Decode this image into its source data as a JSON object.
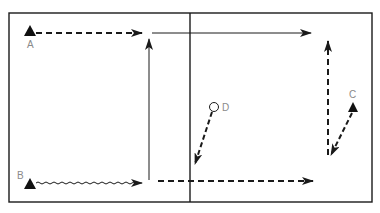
{
  "diagram": {
    "type": "play-diagram",
    "colors": {
      "line": "#1a1a1a",
      "label": "#8a8a8a",
      "background": "#ffffff"
    },
    "players": [
      {
        "id": "A",
        "label": "A",
        "marker": "triangle",
        "x": 30,
        "y": 31
      },
      {
        "id": "B",
        "label": "B",
        "marker": "triangle",
        "x": 30,
        "y": 184
      },
      {
        "id": "C",
        "label": "C",
        "marker": "triangle",
        "x": 353,
        "y": 107
      },
      {
        "id": "D",
        "label": "D",
        "marker": "circle",
        "x": 214,
        "y": 107
      }
    ],
    "paths": [
      {
        "from": "A",
        "style": "dashed",
        "description": "A moves right along top"
      },
      {
        "from": "B",
        "style": "wavy",
        "description": "B dribbles right along bottom"
      },
      {
        "from": "bottom-mid-left",
        "style": "solid",
        "description": "pass up then right along top"
      },
      {
        "from": "right-wing",
        "style": "dashed",
        "description": "cut up right side"
      },
      {
        "from": "C",
        "style": "dashed",
        "description": "C cuts down-left"
      },
      {
        "from": "D",
        "style": "dashed",
        "description": "D moves down-left"
      },
      {
        "from": "bottom-center",
        "style": "dashed",
        "description": "run right along bottom"
      }
    ]
  }
}
